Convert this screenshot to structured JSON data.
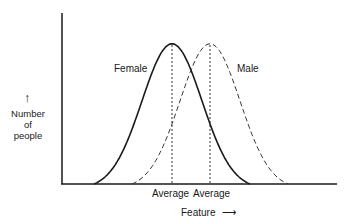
{
  "chart_data": {
    "type": "line",
    "title": "",
    "xlabel": "Feature",
    "ylabel": "Number of people",
    "ylabel_lines": [
      "Number",
      "of",
      "people"
    ],
    "grid": false,
    "legend": "inline labels on curves",
    "x_range": [
      0,
      10
    ],
    "y_range": [
      0,
      1
    ],
    "series": [
      {
        "name": "Female",
        "style": "solid",
        "mean": 4.0,
        "sd": 1.2,
        "peak": 0.82
      },
      {
        "name": "Male",
        "style": "dashed",
        "mean": 5.4,
        "sd": 1.2,
        "peak": 0.82
      }
    ],
    "annotations": [
      {
        "text": "Average",
        "x": 4.0,
        "note": "dotted vertical line at Female mean"
      },
      {
        "text": "Average",
        "x": 5.4,
        "note": "dotted vertical line at Male mean"
      }
    ]
  },
  "labels": {
    "female": "Female",
    "male": "Male",
    "avg_female": "Average",
    "avg_male": "Average",
    "xaxis": "Feature",
    "xarrow": "⟶",
    "yarrow": "↑",
    "y1": "Number",
    "y2": "of",
    "y3": "people"
  }
}
